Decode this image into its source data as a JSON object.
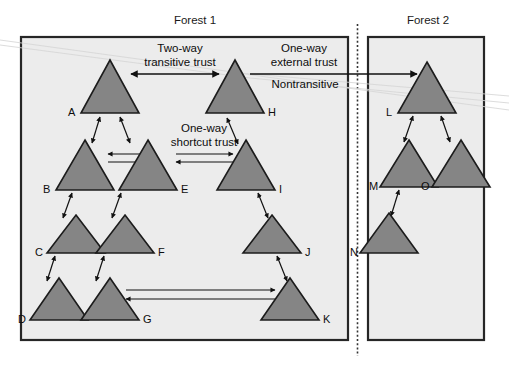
{
  "figure": {
    "type": "diagram",
    "background_color": "#ffffff",
    "panel_fill": "#ececec",
    "triangle_fill": "#858585",
    "triangle_stroke": "#1c1c1c",
    "line_color": "#111111"
  },
  "panels": [
    {
      "id": "forest1",
      "title": "Forest 1"
    },
    {
      "id": "forest2",
      "title": "Forest 2"
    }
  ],
  "annotations": [
    {
      "id": "two-way",
      "line1": "Two-way",
      "line2": "transitive trust"
    },
    {
      "id": "one-way-external",
      "line1": "One-way",
      "line2": "external trust"
    },
    {
      "id": "nontransitive",
      "line1": "Nontransitive",
      "line2": ""
    },
    {
      "id": "one-way-shortcut",
      "line1": "One-way",
      "line2": "shortcut trust"
    }
  ],
  "nodes": [
    {
      "id": "A",
      "label": "A",
      "forest": "forest1"
    },
    {
      "id": "B",
      "label": "B",
      "forest": "forest1"
    },
    {
      "id": "C",
      "label": "C",
      "forest": "forest1"
    },
    {
      "id": "D",
      "label": "D",
      "forest": "forest1"
    },
    {
      "id": "E",
      "label": "E",
      "forest": "forest1"
    },
    {
      "id": "F",
      "label": "F",
      "forest": "forest1"
    },
    {
      "id": "G",
      "label": "G",
      "forest": "forest1"
    },
    {
      "id": "H",
      "label": "H",
      "forest": "forest1"
    },
    {
      "id": "I",
      "label": "I",
      "forest": "forest1"
    },
    {
      "id": "J",
      "label": "J",
      "forest": "forest1"
    },
    {
      "id": "K",
      "label": "K",
      "forest": "forest1"
    },
    {
      "id": "L",
      "label": "L",
      "forest": "forest2"
    },
    {
      "id": "M",
      "label": "M",
      "forest": "forest2"
    },
    {
      "id": "N",
      "label": "N",
      "forest": "forest2"
    },
    {
      "id": "O",
      "label": "O",
      "forest": "forest2"
    }
  ],
  "edges": [
    {
      "from": "A",
      "to": "H",
      "kind": "two-way-transitive"
    },
    {
      "from": "A",
      "to": "B",
      "kind": "two-way-transitive"
    },
    {
      "from": "A",
      "to": "E",
      "kind": "two-way-transitive"
    },
    {
      "from": "B",
      "to": "E",
      "kind": "two-way-transitive"
    },
    {
      "from": "B",
      "to": "C",
      "kind": "two-way-transitive"
    },
    {
      "from": "C",
      "to": "D",
      "kind": "two-way-transitive"
    },
    {
      "from": "E",
      "to": "F",
      "kind": "two-way-transitive"
    },
    {
      "from": "F",
      "to": "G",
      "kind": "two-way-transitive"
    },
    {
      "from": "E",
      "to": "I",
      "kind": "one-way-shortcut"
    },
    {
      "from": "H",
      "to": "I",
      "kind": "two-way-transitive"
    },
    {
      "from": "I",
      "to": "J",
      "kind": "two-way-transitive"
    },
    {
      "from": "J",
      "to": "K",
      "kind": "two-way-transitive"
    },
    {
      "from": "G",
      "to": "K",
      "kind": "one-way-shortcut"
    },
    {
      "from": "H",
      "to": "L",
      "kind": "one-way-external-nontransitive"
    },
    {
      "from": "L",
      "to": "M",
      "kind": "two-way-transitive"
    },
    {
      "from": "L",
      "to": "O",
      "kind": "two-way-transitive"
    },
    {
      "from": "M",
      "to": "N",
      "kind": "two-way-transitive"
    }
  ]
}
